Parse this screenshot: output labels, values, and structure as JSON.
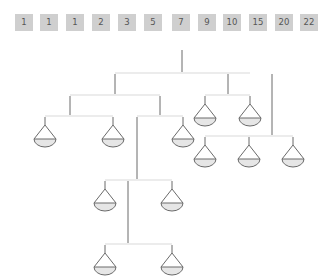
{
  "game": {
    "title": "Balance scales weight puzzle",
    "weights_tray": {
      "tiles": [
        {
          "value": "1",
          "x": 15
        },
        {
          "value": "1",
          "x": 40
        },
        {
          "value": "1",
          "x": 66
        },
        {
          "value": "2",
          "x": 92
        },
        {
          "value": "3",
          "x": 118
        },
        {
          "value": "5",
          "x": 144
        },
        {
          "value": "7",
          "x": 172
        },
        {
          "value": "9",
          "x": 198
        },
        {
          "value": "10",
          "x": 223
        },
        {
          "value": "15",
          "x": 249
        },
        {
          "value": "20",
          "x": 275
        },
        {
          "value": "22",
          "x": 300
        }
      ]
    },
    "colors": {
      "tile_bg": "#cfcfcf",
      "tile_text": "#555555",
      "rod": "#6a6a6a",
      "pan_fill": "#e6e6e6",
      "beam": "#ececec"
    },
    "pans": [
      {
        "id": "pan-1",
        "x": 45,
        "y": 120
      },
      {
        "id": "pan-2",
        "x": 113,
        "y": 120
      },
      {
        "id": "pan-3",
        "x": 183,
        "y": 115
      },
      {
        "id": "pan-4",
        "x": 205,
        "y": 95
      },
      {
        "id": "pan-5",
        "x": 250,
        "y": 95
      },
      {
        "id": "pan-6",
        "x": 205,
        "y": 138
      },
      {
        "id": "pan-7",
        "x": 249,
        "y": 138
      },
      {
        "id": "pan-8",
        "x": 293,
        "y": 138
      },
      {
        "id": "pan-9",
        "x": 105,
        "y": 182
      },
      {
        "id": "pan-10",
        "x": 172,
        "y": 182
      },
      {
        "id": "pan-11",
        "x": 105,
        "y": 245
      },
      {
        "id": "pan-12",
        "x": 172,
        "y": 245
      }
    ]
  }
}
